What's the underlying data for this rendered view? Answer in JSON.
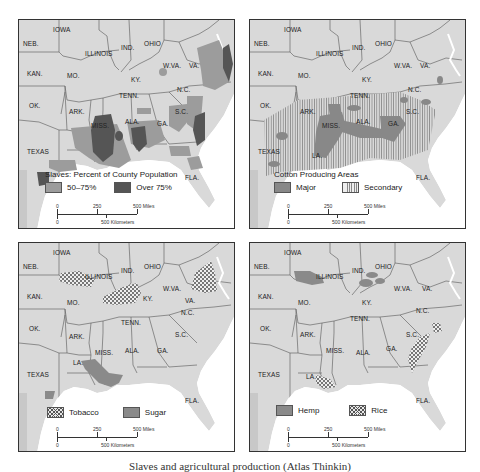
{
  "figure": {
    "caption": "Slaves and agricultural production (Atlas Thinkin)"
  },
  "state_labels": {
    "neb": "NEB.",
    "iowa": "IOWA",
    "illinois": "ILLINOIS",
    "ind": "IND.",
    "ohio": "OHIO",
    "wva": "W.VA.",
    "va": "VA.",
    "kan": "KAN.",
    "mo": "MO.",
    "ky": "KY.",
    "nc": "N.C.",
    "tenn": "TENN.",
    "ok": "OK.",
    "ark": "ARK.",
    "sc": "S.C.",
    "miss": "MISS.",
    "ala": "ALA.",
    "ga": "GA.",
    "texas": "TEXAS",
    "la": "LA.",
    "fla": "FLA."
  },
  "scale_bar": {
    "miles_0": "0",
    "miles_250": "250",
    "miles_500": "500 Miles",
    "km_0": "0",
    "km_500": "500 Kilometers"
  },
  "panels": [
    {
      "id": "slaves",
      "legend_title": "Slaves: Percent of County Population",
      "legend": [
        {
          "label": "50–75%",
          "style": "light-gray",
          "color": "#9c9c9c"
        },
        {
          "label": "Over 75%",
          "style": "dark-gray",
          "color": "#555555"
        }
      ]
    },
    {
      "id": "cotton",
      "legend_title": "Cotton Producing Areas",
      "legend": [
        {
          "label": "Major",
          "style": "solid-gray",
          "color": "#888888"
        },
        {
          "label": "Secondary",
          "style": "vertical-hatch",
          "color": "#888888"
        }
      ]
    },
    {
      "id": "tobacco-sugar",
      "legend_title": "",
      "legend": [
        {
          "label": "Tobacco",
          "style": "crosshatch",
          "color": "#555555"
        },
        {
          "label": "Sugar",
          "style": "solid-gray",
          "color": "#8a8a8a"
        }
      ]
    },
    {
      "id": "hemp-rice",
      "legend_title": "",
      "legend": [
        {
          "label": "Hemp",
          "style": "solid-gray",
          "color": "#8a8a8a"
        },
        {
          "label": "Rice",
          "style": "crosshatch",
          "color": "#555555"
        }
      ]
    }
  ],
  "colors": {
    "land": "#d9d9d9",
    "water": "#ffffff",
    "border": "#555555"
  }
}
